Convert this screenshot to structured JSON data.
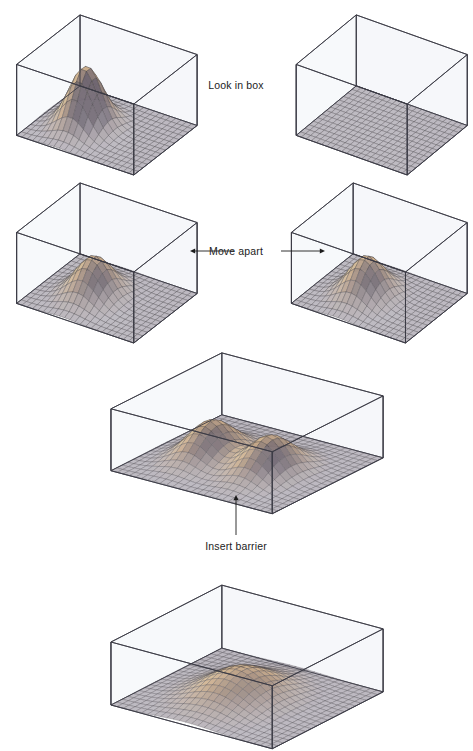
{
  "figure": {
    "kind": "physics-diagram",
    "background": "#ffffff",
    "ink": "#1c1c1c"
  },
  "labels": {
    "look_in_box": "Look in box",
    "move_apart": "Move apart",
    "insert_barrier": "Insert barrier"
  },
  "palette": {
    "box_edge": "#3a3a44",
    "box_wall_tint": "#eef1f6",
    "floor_grid": "#4a4a52",
    "floor_fill": "#b9b4bc",
    "peak_light": "#efe2b4",
    "peak_mid": "#c9ab8a",
    "peak_dark": "#6d6470",
    "mesh_line": "#3d3a42",
    "arrow": "#1c1c1c"
  },
  "chart_data": {
    "type": "surface",
    "zlabel": "probability density",
    "grid": true,
    "panels": [
      {
        "id": "top-left",
        "name": "box-with-particle",
        "shape": "wide",
        "peaks": [
          {
            "cx": 0.34,
            "cy": 0.46,
            "amp": 1.0,
            "sx": 0.12,
            "sy": 0.17
          }
        ],
        "nx": 22,
        "ny": 14
      },
      {
        "id": "top-right",
        "name": "empty-box",
        "shape": "wide",
        "peaks": [],
        "nx": 22,
        "ny": 14
      },
      {
        "id": "mid-left",
        "name": "box-left-after-separation",
        "shape": "wide",
        "peaks": [
          {
            "cx": 0.4,
            "cy": 0.47,
            "amp": 0.66,
            "sx": 0.13,
            "sy": 0.19
          }
        ],
        "nx": 22,
        "ny": 14
      },
      {
        "id": "mid-right",
        "name": "box-right-after-separation",
        "shape": "wide",
        "peaks": [
          {
            "cx": 0.4,
            "cy": 0.47,
            "amp": 0.66,
            "sx": 0.13,
            "sy": 0.19
          }
        ],
        "nx": 22,
        "ny": 14
      },
      {
        "id": "middle",
        "name": "box-with-two-peaks",
        "shape": "square",
        "peaks": [
          {
            "cx": 0.3,
            "cy": 0.46,
            "amp": 0.72,
            "sx": 0.105,
            "sy": 0.17
          },
          {
            "cx": 0.66,
            "cy": 0.46,
            "amp": 0.72,
            "sx": 0.105,
            "sy": 0.17
          }
        ],
        "nx": 26,
        "ny": 20
      },
      {
        "id": "bottom",
        "name": "box-with-single-broad-peak",
        "shape": "square",
        "peaks": [
          {
            "cx": 0.47,
            "cy": 0.47,
            "amp": 0.58,
            "sx": 0.165,
            "sy": 0.22
          }
        ],
        "nx": 26,
        "ny": 20
      }
    ]
  },
  "layout": {
    "panels": [
      {
        "id": "top-left",
        "x": 8,
        "y": 10,
        "w": 192,
        "h": 165
      },
      {
        "id": "top-right",
        "x": 288,
        "y": 10,
        "w": 182,
        "h": 165
      },
      {
        "id": "mid-left",
        "x": 8,
        "y": 178,
        "w": 192,
        "h": 165
      },
      {
        "id": "mid-right",
        "x": 283,
        "y": 178,
        "w": 187,
        "h": 165
      },
      {
        "id": "middle",
        "x": 98,
        "y": 340,
        "w": 288,
        "h": 172
      },
      {
        "id": "bottom",
        "x": 98,
        "y": 572,
        "w": 288,
        "h": 175
      }
    ],
    "captions": [
      {
        "id": "look-in-box",
        "x": 236,
        "y": 80,
        "key": "look_in_box"
      },
      {
        "id": "move-apart",
        "x": 236,
        "y": 246,
        "key": "move_apart"
      },
      {
        "id": "insert-barrier",
        "x": 236,
        "y": 541,
        "key": "insert_barrier"
      }
    ],
    "arrows": [
      {
        "id": "arrow-left",
        "x": 190,
        "y": 244,
        "w": 44,
        "h": 14,
        "dir": "left"
      },
      {
        "id": "arrow-right",
        "x": 281,
        "y": 244,
        "w": 44,
        "h": 14,
        "dir": "right"
      },
      {
        "id": "arrow-up",
        "x": 229,
        "y": 495,
        "w": 14,
        "h": 40,
        "dir": "up"
      }
    ]
  }
}
